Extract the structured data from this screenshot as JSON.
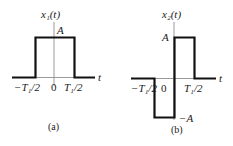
{
  "panels": [
    {
      "caption": "(a)",
      "ylabel": "x₁(t)",
      "xlabel": "t",
      "amplitude_label": "A",
      "ticks": [
        "−T₁/2",
        "0",
        "T₁/2"
      ],
      "signal": "rectangular pulse of height A from −T₁/2 to T₁/2"
    },
    {
      "caption": "(b)",
      "ylabel": "x₂(t)",
      "xlabel": "t",
      "amplitude_label": "A",
      "neg_amplitude_label": "−A",
      "ticks": [
        "−T₁/2",
        "0",
        "T₁/2"
      ],
      "signal": "−A from −T₁/2 to 0, +A from 0 to T₁/2"
    }
  ],
  "colors": {
    "axis": "#9a9a9a",
    "signal": "#111111",
    "text": "#1a1a1a"
  }
}
